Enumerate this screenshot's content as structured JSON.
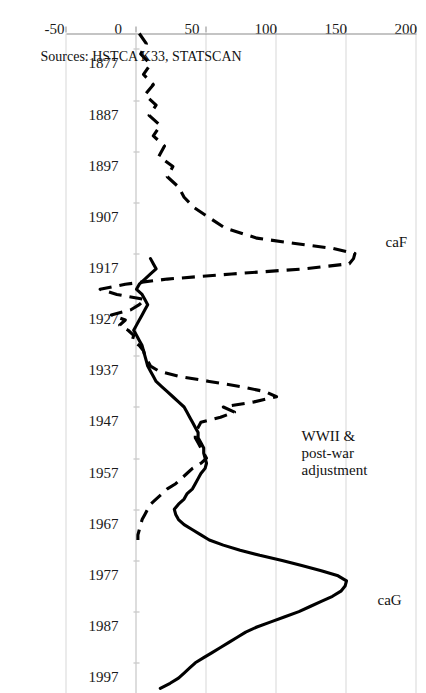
{
  "figure": {
    "source_note": "Sources: HSTCA K33, STATSCAN",
    "orientation": "rotated-90ccw"
  },
  "annotations": [
    {
      "id": "caG",
      "text": "caG",
      "year": 1983,
      "value": 172
    },
    {
      "id": "caF",
      "text": "caF",
      "year": 1913,
      "value": 178
    },
    {
      "id": "wwii",
      "line1": "WWII &",
      "line2": "post-war",
      "line3": "adjustment",
      "year": 1951,
      "value": 118
    }
  ],
  "chart_data": {
    "type": "line",
    "title": "",
    "xlabel": "",
    "ylabel": "",
    "xlim": [
      1874,
      2003
    ],
    "ylim": [
      -50,
      200
    ],
    "grid": true,
    "legend": "inline-labels",
    "x_ticks": [
      1877,
      1887,
      1897,
      1907,
      1917,
      1927,
      1937,
      1947,
      1957,
      1967,
      1977,
      1987,
      1997
    ],
    "x_tick_labels": [
      "1877",
      "1887",
      "1897",
      "1907",
      "1917",
      "1927",
      "1937",
      "1947",
      "1957",
      "1967",
      "1977",
      "1987",
      "1997"
    ],
    "y_ticks": [
      -50,
      0,
      50,
      100,
      150,
      200
    ],
    "y_tick_labels": [
      "-50",
      "0",
      "50",
      "100",
      "150",
      "200"
    ],
    "series": [
      {
        "name": "caF",
        "style": "dashed",
        "color": "#000000",
        "x": [
          1874,
          1876,
          1878,
          1880,
          1882,
          1884,
          1886,
          1888,
          1890,
          1892,
          1894,
          1896,
          1898,
          1900,
          1902,
          1904,
          1906,
          1908,
          1910,
          1912,
          1914,
          1915,
          1916,
          1917,
          1918,
          1919,
          1920,
          1921,
          1922,
          1923,
          1924,
          1925,
          1926,
          1927,
          1928,
          1929,
          1930,
          1931,
          1932,
          1933,
          1934,
          1935,
          1936,
          1937,
          1938,
          1939,
          1940,
          1941,
          1942,
          1943,
          1944,
          1945,
          1946,
          1947,
          1948,
          1949,
          1950,
          1951,
          1952,
          1953,
          1954,
          1955,
          1956,
          1957,
          1958,
          1959,
          1960,
          1961,
          1962,
          1963,
          1964,
          1965,
          1966,
          1967,
          1968,
          1969,
          1970,
          1971,
          1972,
          1973
        ],
        "values": [
          2,
          7,
          3,
          10,
          5,
          12,
          6,
          14,
          9,
          17,
          12,
          20,
          16,
          26,
          22,
          30,
          34,
          41,
          52,
          63,
          86,
          112,
          140,
          156,
          155,
          152,
          120,
          68,
          22,
          -8,
          -26,
          -14,
          6,
          2,
          -4,
          -18,
          -8,
          -12,
          -6,
          -2,
          -3,
          2,
          5,
          6,
          8,
          10,
          16,
          30,
          52,
          74,
          92,
          100,
          84,
          62,
          70,
          60,
          46,
          44,
          42,
          42,
          44,
          46,
          48,
          50,
          46,
          40,
          36,
          32,
          28,
          22,
          18,
          14,
          10,
          8,
          6,
          4,
          3,
          2,
          1,
          1
        ],
        "n_points": 80
      },
      {
        "name": "caG",
        "style": "solid",
        "color": "#000000",
        "x": [
          1918,
          1919,
          1920,
          1921,
          1922,
          1923,
          1924,
          1925,
          1926,
          1927,
          1928,
          1929,
          1930,
          1931,
          1932,
          1933,
          1934,
          1935,
          1936,
          1937,
          1938,
          1939,
          1940,
          1941,
          1942,
          1943,
          1944,
          1945,
          1946,
          1947,
          1948,
          1949,
          1950,
          1951,
          1952,
          1953,
          1954,
          1955,
          1956,
          1957,
          1958,
          1959,
          1960,
          1961,
          1962,
          1963,
          1964,
          1965,
          1966,
          1967,
          1968,
          1969,
          1970,
          1971,
          1972,
          1973,
          1974,
          1975,
          1976,
          1977,
          1978,
          1979,
          1980,
          1981,
          1982,
          1983,
          1984,
          1985,
          1986,
          1987,
          1988,
          1989,
          1990,
          1991,
          1992,
          1993,
          1994,
          1995,
          1996,
          1997,
          1998,
          1999,
          2000,
          2001,
          2002
        ],
        "values": [
          10,
          12,
          14,
          10,
          6,
          2,
          0,
          4,
          6,
          8,
          6,
          4,
          2,
          0,
          -2,
          0,
          2,
          4,
          5,
          6,
          7,
          8,
          10,
          12,
          14,
          18,
          22,
          26,
          30,
          34,
          36,
          38,
          40,
          42,
          44,
          44,
          46,
          48,
          48,
          49,
          50,
          49,
          46,
          44,
          42,
          40,
          36,
          34,
          30,
          27,
          28,
          30,
          34,
          40,
          46,
          52,
          62,
          74,
          88,
          104,
          118,
          132,
          144,
          150,
          149,
          146,
          140,
          132,
          124,
          116,
          106,
          96,
          86,
          78,
          72,
          66,
          60,
          54,
          48,
          42,
          38,
          34,
          30,
          24,
          17
        ],
        "n_points": 85
      }
    ]
  }
}
